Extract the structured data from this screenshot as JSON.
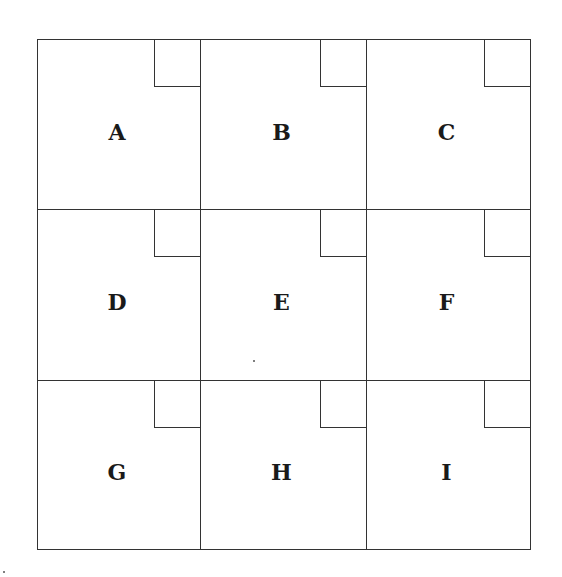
{
  "diagram": {
    "type": "3x3 grid of labeled squares, each with a small square in its top-right corner",
    "cells": [
      {
        "label": "A",
        "row": 1,
        "col": 1
      },
      {
        "label": "B",
        "row": 1,
        "col": 2
      },
      {
        "label": "C",
        "row": 1,
        "col": 3
      },
      {
        "label": "D",
        "row": 2,
        "col": 1
      },
      {
        "label": "E",
        "row": 2,
        "col": 2
      },
      {
        "label": "F",
        "row": 2,
        "col": 3
      },
      {
        "label": "G",
        "row": 3,
        "col": 1
      },
      {
        "label": "H",
        "row": 3,
        "col": 2
      },
      {
        "label": "I",
        "row": 3,
        "col": 3
      }
    ],
    "line_color": "#333333",
    "text_color": "#1a1a1a"
  }
}
